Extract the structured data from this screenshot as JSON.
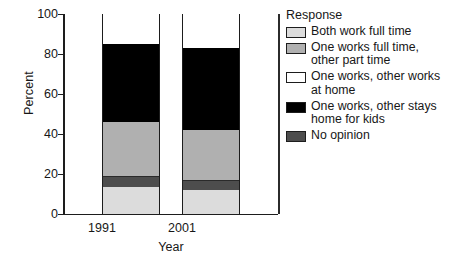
{
  "chart_data": {
    "type": "bar",
    "subtype": "stacked-bar-percent",
    "title": "",
    "xlabel": "Year",
    "ylabel": "Percent",
    "categories": [
      "1991",
      "2001"
    ],
    "ylim": [
      0,
      100
    ],
    "yticks": [
      0,
      20,
      40,
      60,
      80,
      100
    ],
    "ytick_labels": [
      "0",
      "20",
      "40",
      "60",
      "80",
      "100"
    ],
    "grid": false,
    "legend_position": "right",
    "legend_title": "Response",
    "series": [
      {
        "name": "Both work full time",
        "color": "#dcdcdc",
        "values": [
          13.5,
          12
        ]
      },
      {
        "name": "No opinion",
        "color": "#4d4d4d",
        "values": [
          5.5,
          5
        ]
      },
      {
        "name": "One works full time, other part time",
        "color": "#b0b0b0",
        "values": [
          27,
          25
        ]
      },
      {
        "name": "One works, other stays home for kids",
        "color": "#000000",
        "values": [
          39,
          41
        ]
      },
      {
        "name": "One works, other works at home",
        "color": "#ffffff",
        "values": [
          15,
          17
        ]
      }
    ],
    "stack_order_bottom_to_top": [
      "Both work full time",
      "No opinion",
      "One works full time, other part time",
      "One works, other stays home for kids",
      "One works, other works at home"
    ]
  },
  "axes": {
    "y_title": "Percent",
    "x_title": "Year",
    "y_tick_labels": [
      "100",
      "80",
      "60",
      "40",
      "20",
      "0"
    ],
    "x_tick_labels": [
      "1991",
      "2001"
    ]
  },
  "legend": {
    "title": "Response",
    "items": [
      {
        "label": "Both work full time",
        "color": "#dcdcdc"
      },
      {
        "label": "One works full time,\nother part time",
        "color": "#b0b0b0"
      },
      {
        "label": "One works, other works\nat home",
        "color": "#ffffff"
      },
      {
        "label": "One works, other stays\nhome for kids",
        "color": "#000000"
      },
      {
        "label": "No opinion",
        "color": "#4d4d4d"
      }
    ]
  }
}
